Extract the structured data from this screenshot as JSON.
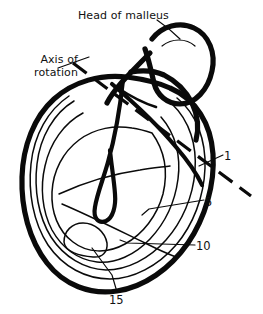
{
  "figure": {
    "title_text": "Head of malleus",
    "background_color": "#ffffff",
    "ink_color": "#0a0a0a",
    "width": 263,
    "height": 314
  },
  "labels": {
    "head_of_malleus": "Head of malleus",
    "axis_of_rotation": "Axis of\nrotation"
  },
  "numbered_markers": [
    {
      "id": "marker-1",
      "text": "1"
    },
    {
      "id": "marker-5",
      "text": "5"
    },
    {
      "id": "marker-10",
      "text": "10"
    },
    {
      "id": "marker-15",
      "text": "15"
    }
  ],
  "strokes": {
    "tympanic_outer_rim": "thick-outline",
    "contour_rings": "thin-nested-curves",
    "manubrium": "thick-handle-curve",
    "malleus_head": "thick-rounded-blob",
    "axis_line": "dashed-thick"
  }
}
